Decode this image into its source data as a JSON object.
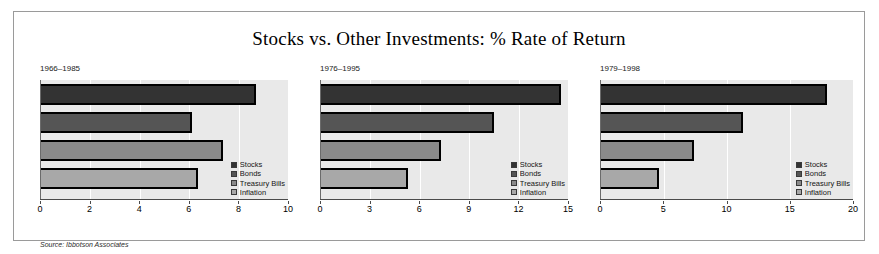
{
  "figure": {
    "title": "Stocks vs. Other Investments: % Rate of Return",
    "source_note": "Source: Ibbotson Associates"
  },
  "legend": {
    "entries": [
      "Stocks",
      "Bonds",
      "Treasury Bills",
      "Inflation"
    ]
  },
  "chart_data": [
    {
      "type": "bar",
      "orientation": "horizontal",
      "title": "1966–1985",
      "categories": [
        "Stocks",
        "Bonds",
        "Treasury Bills",
        "Inflation"
      ],
      "values": [
        8.7,
        6.1,
        7.35,
        6.35
      ],
      "xlabel": "",
      "ylabel": "",
      "xlim": [
        0,
        10
      ],
      "xticks": [
        0,
        2,
        4,
        6,
        8,
        10
      ],
      "grid": true,
      "legend_position": "lower-right",
      "series": [
        {
          "name": "Stocks",
          "value": 8.7,
          "color": "#333333"
        },
        {
          "name": "Bonds",
          "value": 6.1,
          "color": "#555555"
        },
        {
          "name": "Treasury Bills",
          "value": 7.35,
          "color": "#8a8a8a"
        },
        {
          "name": "Inflation",
          "value": 6.35,
          "color": "#a8a8a8"
        }
      ]
    },
    {
      "type": "bar",
      "orientation": "horizontal",
      "title": "1976–1995",
      "categories": [
        "Stocks",
        "Bonds",
        "Treasury Bills",
        "Inflation"
      ],
      "values": [
        14.6,
        10.5,
        7.3,
        5.3
      ],
      "xlabel": "",
      "ylabel": "",
      "xlim": [
        0,
        15
      ],
      "xticks": [
        0,
        3,
        6,
        9,
        12,
        15
      ],
      "grid": true,
      "legend_position": "lower-right",
      "series": [
        {
          "name": "Stocks",
          "value": 14.6,
          "color": "#333333"
        },
        {
          "name": "Bonds",
          "value": 10.5,
          "color": "#555555"
        },
        {
          "name": "Treasury Bills",
          "value": 7.3,
          "color": "#8a8a8a"
        },
        {
          "name": "Inflation",
          "value": 5.3,
          "color": "#a8a8a8"
        }
      ]
    },
    {
      "type": "bar",
      "orientation": "horizontal",
      "title": "1979–1998",
      "categories": [
        "Stocks",
        "Bonds",
        "Treasury Bills",
        "Inflation"
      ],
      "values": [
        17.9,
        11.3,
        7.4,
        4.6
      ],
      "xlabel": "",
      "ylabel": "",
      "xlim": [
        0,
        20
      ],
      "xticks": [
        0,
        5,
        10,
        15,
        20
      ],
      "grid": true,
      "legend_position": "lower-right",
      "series": [
        {
          "name": "Stocks",
          "value": 17.9,
          "color": "#333333"
        },
        {
          "name": "Bonds",
          "value": 11.3,
          "color": "#555555"
        },
        {
          "name": "Treasury Bills",
          "value": 7.4,
          "color": "#8a8a8a"
        },
        {
          "name": "Inflation",
          "value": 4.6,
          "color": "#a8a8a8"
        }
      ]
    }
  ]
}
